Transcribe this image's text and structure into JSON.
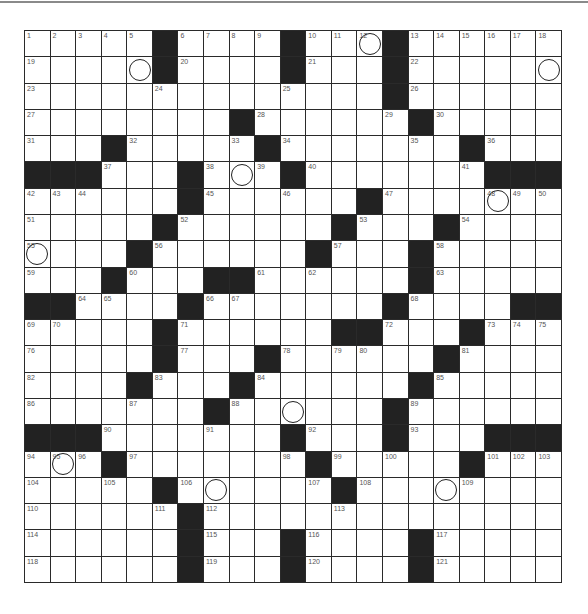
{
  "puzzle": {
    "size": {
      "rows": 21,
      "cols": 21
    },
    "grid": [
      ".....#....#...#......",
      ".....#....#...#......",
      "..............#......",
      "........#......#.....",
      "...#.....#.......#...",
      "###...#...#.......###",
      "......#......#.......",
      ".....#......#...#....",
      "....#......#...#.....",
      "...#...##......#.....",
      "##....#.......#....##",
      ".....#......##...#...",
      ".....#...#......#....",
      "....#...#......#.....",
      ".......#......#......",
      "###.......#...#...###",
      "...#.......#.....#...",
      ".....#......#........",
      "......#..............",
      "......#...#....#.....",
      "......#...#....#....."
    ],
    "numbers": [
      [
        1,
        1,
        "1"
      ],
      [
        1,
        2,
        "2"
      ],
      [
        1,
        3,
        "3"
      ],
      [
        1,
        4,
        "4"
      ],
      [
        1,
        5,
        "5"
      ],
      [
        1,
        7,
        "6"
      ],
      [
        1,
        8,
        "7"
      ],
      [
        1,
        9,
        "8"
      ],
      [
        1,
        10,
        "9"
      ],
      [
        1,
        12,
        "10"
      ],
      [
        1,
        13,
        "11"
      ],
      [
        1,
        14,
        "12"
      ],
      [
        1,
        16,
        "13"
      ],
      [
        1,
        17,
        "14"
      ],
      [
        1,
        18,
        "15"
      ],
      [
        1,
        19,
        "16"
      ],
      [
        1,
        20,
        "17"
      ],
      [
        1,
        21,
        "18"
      ],
      [
        2,
        1,
        "19"
      ],
      [
        2,
        7,
        "20"
      ],
      [
        2,
        12,
        "21"
      ],
      [
        2,
        16,
        "22"
      ],
      [
        3,
        1,
        "23"
      ],
      [
        3,
        6,
        "24"
      ],
      [
        3,
        11,
        "25"
      ],
      [
        3,
        16,
        "26"
      ],
      [
        4,
        1,
        "27"
      ],
      [
        4,
        10,
        "28"
      ],
      [
        4,
        15,
        "29"
      ],
      [
        4,
        17,
        "30"
      ],
      [
        5,
        1,
        "31"
      ],
      [
        5,
        5,
        "32"
      ],
      [
        5,
        9,
        "33"
      ],
      [
        5,
        11,
        "34"
      ],
      [
        5,
        16,
        "35"
      ],
      [
        5,
        19,
        "36"
      ],
      [
        6,
        4,
        "37"
      ],
      [
        6,
        8,
        "38"
      ],
      [
        6,
        10,
        "39"
      ],
      [
        6,
        12,
        "40"
      ],
      [
        6,
        18,
        "41"
      ],
      [
        7,
        1,
        "42"
      ],
      [
        7,
        2,
        "43"
      ],
      [
        7,
        3,
        "44"
      ],
      [
        7,
        8,
        "45"
      ],
      [
        7,
        11,
        "46"
      ],
      [
        7,
        15,
        "47"
      ],
      [
        7,
        19,
        "48"
      ],
      [
        7,
        20,
        "49"
      ],
      [
        7,
        21,
        "50"
      ],
      [
        8,
        1,
        "51"
      ],
      [
        8,
        7,
        "52"
      ],
      [
        8,
        14,
        "53"
      ],
      [
        8,
        18,
        "54"
      ],
      [
        9,
        1,
        "55"
      ],
      [
        9,
        6,
        "56"
      ],
      [
        9,
        13,
        "57"
      ],
      [
        9,
        17,
        "58"
      ],
      [
        10,
        1,
        "59"
      ],
      [
        10,
        5,
        "60"
      ],
      [
        10,
        10,
        "61"
      ],
      [
        10,
        12,
        "62"
      ],
      [
        10,
        17,
        "63"
      ],
      [
        11,
        3,
        "64"
      ],
      [
        11,
        4,
        "65"
      ],
      [
        11,
        8,
        "66"
      ],
      [
        11,
        9,
        "67"
      ],
      [
        11,
        16,
        "68"
      ],
      [
        12,
        1,
        "69"
      ],
      [
        12,
        2,
        "70"
      ],
      [
        12,
        7,
        "71"
      ],
      [
        12,
        15,
        "72"
      ],
      [
        12,
        19,
        "73"
      ],
      [
        12,
        20,
        "74"
      ],
      [
        12,
        21,
        "75"
      ],
      [
        13,
        1,
        "76"
      ],
      [
        13,
        7,
        "77"
      ],
      [
        13,
        11,
        "78"
      ],
      [
        13,
        13,
        "79"
      ],
      [
        13,
        14,
        "80"
      ],
      [
        13,
        18,
        "81"
      ],
      [
        14,
        1,
        "82"
      ],
      [
        14,
        6,
        "83"
      ],
      [
        14,
        10,
        "84"
      ],
      [
        14,
        17,
        "85"
      ],
      [
        15,
        1,
        "86"
      ],
      [
        15,
        5,
        "87"
      ],
      [
        15,
        9,
        "88"
      ],
      [
        15,
        16,
        "89"
      ],
      [
        16,
        4,
        "90"
      ],
      [
        16,
        8,
        "91"
      ],
      [
        16,
        12,
        "92"
      ],
      [
        16,
        16,
        "93"
      ],
      [
        17,
        1,
        "94"
      ],
      [
        17,
        2,
        "95"
      ],
      [
        17,
        3,
        "96"
      ],
      [
        17,
        5,
        "97"
      ],
      [
        17,
        11,
        "98"
      ],
      [
        17,
        13,
        "99"
      ],
      [
        17,
        15,
        "100"
      ],
      [
        17,
        19,
        "101"
      ],
      [
        17,
        20,
        "102"
      ],
      [
        17,
        21,
        "103"
      ],
      [
        18,
        1,
        "104"
      ],
      [
        18,
        4,
        "105"
      ],
      [
        18,
        7,
        "106"
      ],
      [
        18,
        12,
        "107"
      ],
      [
        18,
        14,
        "108"
      ],
      [
        18,
        18,
        "109"
      ],
      [
        19,
        1,
        "110"
      ],
      [
        19,
        6,
        "111"
      ],
      [
        19,
        8,
        "112"
      ],
      [
        19,
        13,
        "113"
      ],
      [
        20,
        1,
        "114"
      ],
      [
        20,
        8,
        "115"
      ],
      [
        20,
        12,
        "116"
      ],
      [
        20,
        17,
        "117"
      ],
      [
        21,
        1,
        "118"
      ],
      [
        21,
        8,
        "119"
      ],
      [
        21,
        12,
        "120"
      ],
      [
        21,
        17,
        "121"
      ]
    ],
    "circles": [
      [
        1,
        14
      ],
      [
        2,
        5
      ],
      [
        2,
        21
      ],
      [
        6,
        9
      ],
      [
        7,
        19
      ],
      [
        9,
        1
      ],
      [
        15,
        11
      ],
      [
        17,
        2
      ],
      [
        18,
        8
      ],
      [
        18,
        17
      ]
    ],
    "colors": {
      "black_square": "#222222",
      "grid_line": "#2a2a2a",
      "number_text": "#555555"
    }
  }
}
